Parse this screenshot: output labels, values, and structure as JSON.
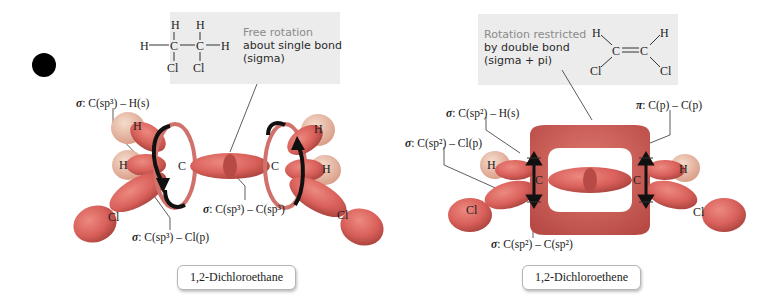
{
  "left_panel": {
    "structure": {
      "atoms": [
        "H",
        "H",
        "H",
        "C",
        "C",
        "H",
        "Cl",
        "Cl"
      ]
    },
    "callout": {
      "line1": "Free rotation",
      "line2": "about single bond",
      "line3": "(sigma)"
    },
    "labels": {
      "sigma_ch": {
        "prefix": "σ",
        "text": ": C(sp³) – H(s)"
      },
      "sigma_cc": {
        "prefix": "σ",
        "text": ": C(sp³) – C(sp³)"
      },
      "sigma_ccl": {
        "prefix": "σ",
        "text": ": C(sp³) – Cl(p)"
      }
    },
    "name": "1,2-Dichloroethane"
  },
  "right_panel": {
    "structure": {
      "atoms": [
        "H",
        "C",
        "C",
        "H",
        "Cl",
        "Cl"
      ]
    },
    "callout": {
      "line1": "Rotation restricted",
      "line2": "by double bond",
      "line3": "(sigma + pi)"
    },
    "labels": {
      "sigma_ch": {
        "prefix": "σ",
        "text": ": C(sp²) – H(s)"
      },
      "sigma_ccl": {
        "prefix": "σ",
        "text": ": C(sp²) – Cl(p)"
      },
      "pi_cc": {
        "prefix": "π",
        "text": ": C(p) – C(p)"
      },
      "sigma_cc": {
        "prefix": "σ",
        "text": ": C(sp²) – C(sp²)"
      }
    },
    "name": "1,2-Dichloroethene"
  },
  "orbital_atoms": {
    "H": "H",
    "C": "C",
    "Cl": "Cl"
  },
  "colors": {
    "lobe": "#d9605a",
    "lobe_dark": "#b84a45",
    "h_sphere": "#e8b5a0",
    "callout_bg": "#ececec",
    "arrow": "#111111"
  }
}
